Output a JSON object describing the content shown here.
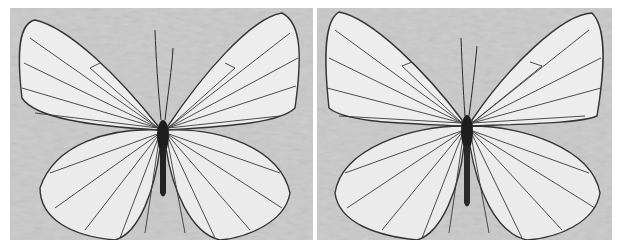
{
  "image": {
    "description": "Two photographs side by side of a black-veined white butterfly, wings spread, on a mottled grey background, grayscale",
    "panels": [
      {
        "id": "left",
        "subject": "butterfly-dorsal-view",
        "tone": "grayscale"
      },
      {
        "id": "right",
        "subject": "butterfly-dorsal-view",
        "tone": "grayscale"
      }
    ]
  },
  "colors": {
    "background": "#c9c9c9",
    "wing": "#ececec",
    "vein": "#2a2a2a",
    "body": "#1e1e1e",
    "page": "#ffffff"
  }
}
